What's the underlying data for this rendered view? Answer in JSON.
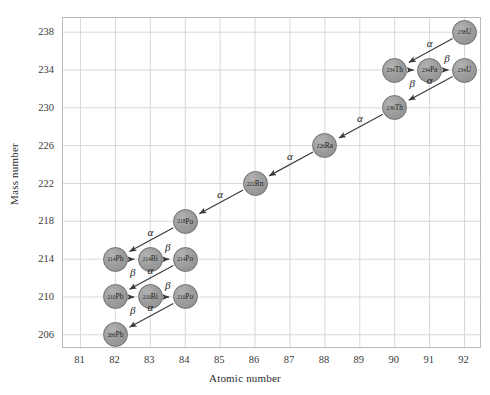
{
  "chart_data": {
    "type": "scatter",
    "title": "",
    "xlabel": "Atomic number",
    "ylabel": "Mass number",
    "xlim": [
      80.5,
      92.5
    ],
    "ylim": [
      204.5,
      239.5
    ],
    "grid": true,
    "legend": null,
    "xticks": [
      81,
      82,
      83,
      84,
      85,
      86,
      87,
      88,
      89,
      90,
      91,
      92
    ],
    "yticks": [
      206,
      210,
      214,
      218,
      222,
      226,
      230,
      234,
      238
    ],
    "nodes": [
      {
        "id": "U238",
        "label": "U",
        "mass": 238,
        "z": 92,
        "sup": "238"
      },
      {
        "id": "Th234",
        "label": "Th",
        "mass": 234,
        "z": 90,
        "sup": "234"
      },
      {
        "id": "Pa234",
        "label": "Pa",
        "mass": 234,
        "z": 91,
        "sup": "234"
      },
      {
        "id": "U234",
        "label": "U",
        "mass": 234,
        "z": 92,
        "sup": "234"
      },
      {
        "id": "Th230",
        "label": "Th",
        "mass": 230,
        "z": 90,
        "sup": "230"
      },
      {
        "id": "Ra226",
        "label": "Ra",
        "mass": 226,
        "z": 88,
        "sup": "226"
      },
      {
        "id": "Rn222",
        "label": "Rn",
        "mass": 222,
        "z": 86,
        "sup": "222"
      },
      {
        "id": "Po218",
        "label": "Po",
        "mass": 218,
        "z": 84,
        "sup": "218"
      },
      {
        "id": "Pb214",
        "label": "Pb",
        "mass": 214,
        "z": 82,
        "sup": "214"
      },
      {
        "id": "Bi214",
        "label": "Bi",
        "mass": 214,
        "z": 83,
        "sup": "214"
      },
      {
        "id": "Po214",
        "label": "Po",
        "mass": 214,
        "z": 84,
        "sup": "214"
      },
      {
        "id": "Pb210",
        "label": "Pb",
        "mass": 210,
        "z": 82,
        "sup": "210"
      },
      {
        "id": "Bi210",
        "label": "Bi",
        "mass": 210,
        "z": 83,
        "sup": "210"
      },
      {
        "id": "Po210",
        "label": "Po",
        "mass": 210,
        "z": 84,
        "sup": "210"
      },
      {
        "id": "Pb206",
        "label": "Pb",
        "mass": 206,
        "z": 82,
        "sup": "206"
      }
    ],
    "edges": [
      {
        "from": "U238",
        "to": "Th234",
        "mode": "α",
        "label_z": 91.0,
        "label_a": 236.9
      },
      {
        "from": "Th234",
        "to": "Pa234",
        "mode": "β",
        "label_z": 90.5,
        "label_a": 232.6
      },
      {
        "from": "Pa234",
        "to": "U234",
        "mode": "β",
        "label_z": 91.5,
        "label_a": 235.3
      },
      {
        "from": "U234",
        "to": "Th230",
        "mode": "α",
        "label_z": 91.0,
        "label_a": 232.9
      },
      {
        "from": "Th230",
        "to": "Ra226",
        "mode": "α",
        "label_z": 89.0,
        "label_a": 228.9
      },
      {
        "from": "Ra226",
        "to": "Rn222",
        "mode": "α",
        "label_z": 87.0,
        "label_a": 224.9
      },
      {
        "from": "Rn222",
        "to": "Po218",
        "mode": "α",
        "label_z": 85.0,
        "label_a": 220.9
      },
      {
        "from": "Po218",
        "to": "Pb214",
        "mode": "α",
        "label_z": 83.0,
        "label_a": 216.9
      },
      {
        "from": "Pb214",
        "to": "Bi214",
        "mode": "β",
        "label_z": 82.5,
        "label_a": 212.6
      },
      {
        "from": "Bi214",
        "to": "Po214",
        "mode": "β",
        "label_z": 83.5,
        "label_a": 215.3
      },
      {
        "from": "Po214",
        "to": "Pb210",
        "mode": "α",
        "label_z": 83.0,
        "label_a": 212.9
      },
      {
        "from": "Pb210",
        "to": "Bi210",
        "mode": "β",
        "label_z": 82.5,
        "label_a": 208.6
      },
      {
        "from": "Bi210",
        "to": "Po210",
        "mode": "β",
        "label_z": 83.5,
        "label_a": 211.3
      },
      {
        "from": "Po210",
        "to": "Pb206",
        "mode": "α",
        "label_z": 83.0,
        "label_a": 208.9
      }
    ]
  },
  "colors": {
    "node_fill": "#9d9d9d",
    "node_stroke": "#6f6f6f",
    "grid": "#d8d8d8",
    "frame": "#b9b9b9",
    "arrow": "#3a3a3a",
    "text": "#2b2b2b",
    "background": "#ffffff"
  }
}
